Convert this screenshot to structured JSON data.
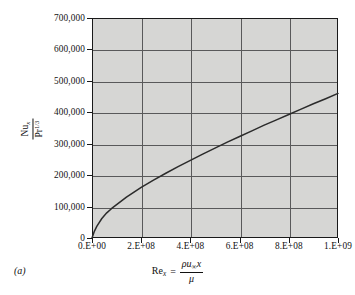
{
  "figure": {
    "panel_label": "(a)",
    "background_color": "#ffffff",
    "plot_background_color": "#d6d6d4",
    "grid_color": "#59595a",
    "axis_color": "#1a1a1a",
    "curve_color": "#2b2b2b"
  },
  "axis_titles": {
    "y": {
      "numerator_main": "Nu",
      "numerator_sub": "x",
      "denominator_main": "Pr",
      "denominator_sup": "1/3",
      "plain": "Nu_x / Pr^(1/3)"
    },
    "x": {
      "lhs_main": "Re",
      "lhs_sub": "x",
      "equals": "=",
      "numerator": "ρu",
      "numerator_sub": "∞",
      "numerator_tail": "x",
      "denominator": "μ",
      "plain": "Re_x = ρu∞x / μ"
    }
  },
  "chart_data": {
    "type": "line",
    "title": "",
    "subtitle": "",
    "xlabel": "Re_x = ρu∞x / μ",
    "ylabel": "Nu_x / Pr^(1/3)",
    "xlim": [
      0,
      1000000000
    ],
    "ylim": [
      0,
      700000
    ],
    "grid": true,
    "legend": null,
    "x_tick_labels": [
      "0.E+00",
      "2.E+08",
      "4.E+08",
      "6.E+08",
      "8.E+08",
      "1.E+09"
    ],
    "x_tick_values": [
      0,
      200000000,
      400000000,
      600000000,
      800000000,
      1000000000
    ],
    "y_tick_labels": [
      "0",
      "100,000",
      "200,000",
      "300,000",
      "400,000",
      "500,000",
      "600,000",
      "700,000"
    ],
    "y_tick_values": [
      0,
      100000,
      200000,
      300000,
      400000,
      500000,
      600000,
      700000
    ],
    "series": [
      {
        "name": "Nu_x/Pr^(1/3) vs Re_x",
        "x": [
          0,
          10000000,
          20000000,
          40000000,
          60000000,
          80000000,
          100000000,
          140000000,
          180000000,
          200000000,
          250000000,
          300000000,
          350000000,
          400000000,
          450000000,
          500000000,
          550000000,
          600000000,
          650000000,
          700000000,
          750000000,
          800000000,
          850000000,
          900000000,
          950000000,
          1000000000
        ],
        "y": [
          0,
          22000,
          38000,
          62000,
          80000,
          94000,
          106000,
          130000,
          151000,
          161000,
          184000,
          206000,
          227000,
          247000,
          267000,
          286000,
          305000,
          323000,
          341000,
          359000,
          376000,
          393000,
          410000,
          427000,
          443000,
          460000
        ]
      }
    ]
  }
}
